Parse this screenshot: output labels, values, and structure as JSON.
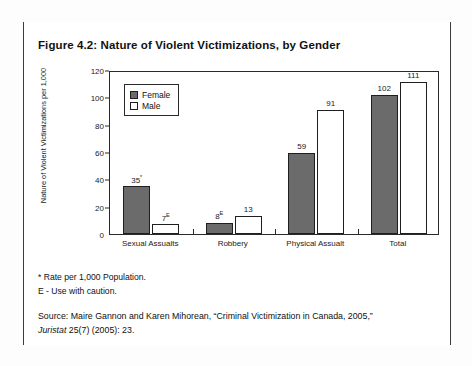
{
  "figure": {
    "title": "Figure 4.2: Nature of Violent Victimizations, by Gender",
    "notes": [
      "* Rate per 1,000 Population.",
      "E - Use with caution."
    ],
    "source": {
      "lead": "Source: Maire Gannon and Karen Mihorean, “Criminal Victimization in Canada, 2005,”",
      "italic_part": "Juristat",
      "tail": " 25(7) (2005): 23."
    }
  },
  "chart_data": {
    "type": "bar",
    "title": "Figure 4.2: Nature of Violent Victimizations, by Gender",
    "xlabel": "",
    "ylabel": "Nature of Violent Victimizations per 1,000",
    "ylim": [
      0,
      120
    ],
    "yticks": [
      0,
      20,
      40,
      60,
      80,
      100,
      120
    ],
    "grid": false,
    "legend_position": "top-left",
    "categories": [
      "Sexual Assualts",
      "Robbery",
      "Physical Assualt",
      "Total"
    ],
    "series": [
      {
        "name": "Female",
        "color": "#6b6b6b",
        "values": [
          35,
          8,
          59,
          102
        ],
        "labels": [
          "35*",
          "8E",
          "59",
          "102"
        ],
        "label_text": [
          "35",
          "8",
          "59",
          "102"
        ],
        "label_sup": [
          "*",
          "E",
          "",
          ""
        ]
      },
      {
        "name": "Male",
        "color": "#ffffff",
        "values": [
          7,
          13,
          91,
          111
        ],
        "labels": [
          "7E",
          "13",
          "91",
          "111"
        ],
        "label_text": [
          "7",
          "13",
          "91",
          "111"
        ],
        "label_sup": [
          "E",
          "",
          "",
          ""
        ]
      }
    ]
  }
}
